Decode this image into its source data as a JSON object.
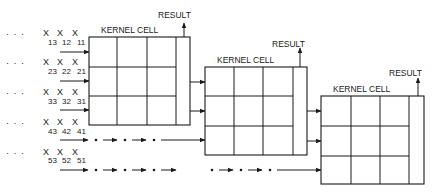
{
  "diagram": {
    "type": "systolic-array-pipeline",
    "stage_label": "KERNEL CELL",
    "output_label": "RESULT",
    "stages": [
      {
        "id": 1,
        "label": "KERNEL CELL",
        "output": "RESULT"
      },
      {
        "id": 2,
        "label": "KERNEL CELL",
        "output": "RESULT"
      },
      {
        "id": 3,
        "label": "KERNEL CELL",
        "output": "RESULT"
      }
    ],
    "input_rows": [
      {
        "row": 1,
        "leader": "· · ·",
        "symbol": "X",
        "subscripts": [
          "13",
          "12",
          "11"
        ]
      },
      {
        "row": 2,
        "leader": "· · ·",
        "symbol": "X",
        "subscripts": [
          "23",
          "22",
          "21"
        ]
      },
      {
        "row": 3,
        "leader": "· · ·",
        "symbol": "X",
        "subscripts": [
          "33",
          "32",
          "31"
        ]
      },
      {
        "row": 4,
        "leader": "· · ·",
        "symbol": "X",
        "subscripts": [
          "43",
          "42",
          "41"
        ]
      },
      {
        "row": 5,
        "leader": "· · ·",
        "symbol": "X",
        "subscripts": [
          "53",
          "52",
          "51"
        ]
      }
    ],
    "grid": {
      "rows": 3,
      "cols": 3,
      "result_column": true
    },
    "colors": {
      "line": "#1a1a1a",
      "background": "#ffffff"
    }
  }
}
